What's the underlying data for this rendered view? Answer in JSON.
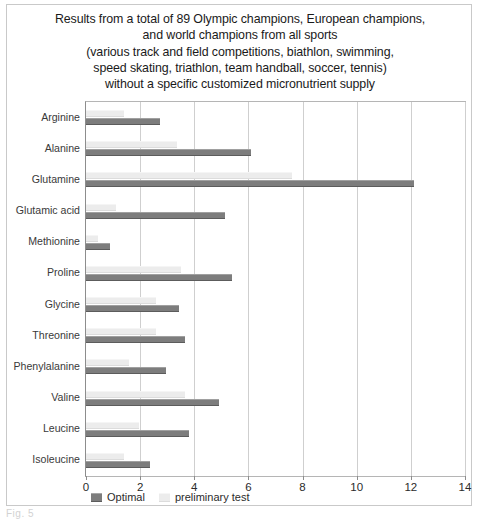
{
  "figure": {
    "caption": "Fig. 5",
    "title_lines": [
      "Results from a total of 89 Olympic champions, European champions,",
      "and world champions from all sports",
      "(various track and field competitions, biathlon, swimming,",
      "speed skating, triathlon, team handball, soccer, tennis)",
      "without a specific customized micronutrient supply"
    ]
  },
  "colors": {
    "optimal": "#7d7d7d",
    "preliminary": "#ececec",
    "grid": "#cfcfcf",
    "axis": "#8d8d8d",
    "border": "#c9c9c9",
    "text": "#2b2b2b"
  },
  "chart_data": {
    "type": "bar",
    "orientation": "horizontal",
    "xlabel": "",
    "ylabel": "",
    "xlim": [
      0,
      14
    ],
    "xticks": [
      0,
      2,
      4,
      6,
      8,
      10,
      12,
      14
    ],
    "xtick_labels": [
      "0",
      "2",
      "4",
      "6",
      "8",
      "10",
      "12",
      "14"
    ],
    "grid": true,
    "legend_position": "bottom-left",
    "categories": [
      "Arginine",
      "Alanine",
      "Glutamine",
      "Glutamic acid",
      "Methionine",
      "Proline",
      "Glycine",
      "Threonine",
      "Phenylalanine",
      "Valine",
      "Leucine",
      "Isoleucine"
    ],
    "series": [
      {
        "name": "Optimal",
        "color": "#7d7d7d",
        "values": [
          2.75,
          6.1,
          12.1,
          5.15,
          0.9,
          5.4,
          3.45,
          3.65,
          2.95,
          4.9,
          3.8,
          2.35
        ]
      },
      {
        "name": "preliminary test",
        "color": "#ececec",
        "values": [
          1.4,
          3.35,
          7.6,
          1.1,
          0.45,
          3.5,
          2.6,
          2.6,
          1.6,
          3.65,
          1.95,
          1.4
        ]
      }
    ]
  }
}
